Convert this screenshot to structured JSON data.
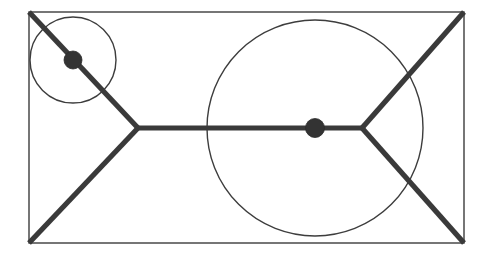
{
  "canvas": {
    "width": 494,
    "height": 257,
    "background": "#ffffff",
    "title": "Steiner tree / Y-junction diagram inscribed in a rectangle"
  },
  "style": {
    "thin_stroke_color": "#3d3d3d",
    "thin_stroke_width": 1.4,
    "thick_stroke_color": "#3a3a3a",
    "thick_stroke_width": 5.2,
    "node_fill": "#333333",
    "node_stroke": "#2b2b2b"
  },
  "shapes": {
    "rectangle": {
      "name": "bounding-rectangle",
      "x": 29,
      "y": 12,
      "width": 435,
      "height": 231,
      "corners": {
        "top_left": [
          29,
          12
        ],
        "top_right": [
          464,
          12
        ],
        "bottom_right": [
          464,
          243
        ],
        "bottom_left": [
          29,
          243
        ]
      }
    },
    "small_circle": {
      "name": "small-circle",
      "cx": 73,
      "cy": 60,
      "r": 43
    },
    "large_circle": {
      "name": "large-circle",
      "cx": 315,
      "cy": 128,
      "r": 108
    }
  },
  "vertices": {
    "left_junction": {
      "name": "left-y-junction",
      "x": 138,
      "y": 128
    },
    "right_junction": {
      "name": "right-y-junction",
      "x": 362,
      "y": 128
    }
  },
  "edges": [
    {
      "name": "edge-top-left-to-left-junction",
      "x1": 29,
      "y1": 12,
      "x2": 138,
      "y2": 128
    },
    {
      "name": "edge-bottom-left-to-left-junction",
      "x1": 29,
      "y1": 243,
      "x2": 138,
      "y2": 128
    },
    {
      "name": "edge-spine-horizontal",
      "x1": 138,
      "y1": 128,
      "x2": 362,
      "y2": 128
    },
    {
      "name": "edge-top-right-to-right-junction",
      "x1": 464,
      "y1": 12,
      "x2": 362,
      "y2": 128
    },
    {
      "name": "edge-bottom-right-to-right-junction",
      "x1": 464,
      "y1": 243,
      "x2": 362,
      "y2": 128
    }
  ],
  "nodes": [
    {
      "name": "node-small-circle-center",
      "cx": 73,
      "cy": 60,
      "r": 9
    },
    {
      "name": "node-large-circle-center",
      "cx": 315,
      "cy": 128,
      "r": 9.5
    }
  ]
}
